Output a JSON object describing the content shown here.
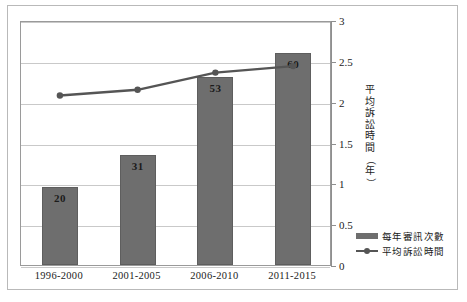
{
  "chart_data": {
    "type": "bar",
    "title": "",
    "subtitle": "",
    "xlabel": "",
    "ylabel": "平均訴訟時間（年）",
    "ylabel_chars": [
      "平",
      "均",
      "訴",
      "訟",
      "時",
      "間",
      "（",
      "年",
      "）"
    ],
    "ylim": [
      0,
      3
    ],
    "yticks": [
      "0",
      "0.5",
      "1",
      "1.5",
      "2",
      "2.5",
      "3"
    ],
    "ytick_values": [
      0,
      0.5,
      1,
      1.5,
      2,
      2.5,
      3
    ],
    "grid": true,
    "legend_position": "right-bottom",
    "categories": [
      "1996-2000",
      "2001-2005",
      "2006-2010",
      "2011-2015"
    ],
    "series": [
      {
        "name": "每年審訊次數",
        "type": "bar",
        "color": "#6e6e6e",
        "labels": [
          "20",
          "31",
          "53",
          "60"
        ],
        "values": [
          20,
          31,
          53,
          60
        ],
        "plotted_values": [
          0.96,
          1.35,
          2.3,
          2.6
        ]
      },
      {
        "name": "平均訴訟時間",
        "type": "line",
        "color": "#555555",
        "values": [
          2.1,
          2.17,
          2.38,
          2.46
        ]
      }
    ]
  },
  "colors": {
    "bar": "#6e6e6e",
    "line": "#555555",
    "grid": "#c9c9c9",
    "axis": "#8f8f8f",
    "frame": "#b9b9b9",
    "text": "#1b1b1b",
    "background": "#ffffff"
  },
  "legend": {
    "items": [
      {
        "label": "每年審訊次數",
        "marker": "bar-swatch"
      },
      {
        "label": "平均訴訟時間",
        "marker": "line-marker-swatch"
      }
    ]
  }
}
